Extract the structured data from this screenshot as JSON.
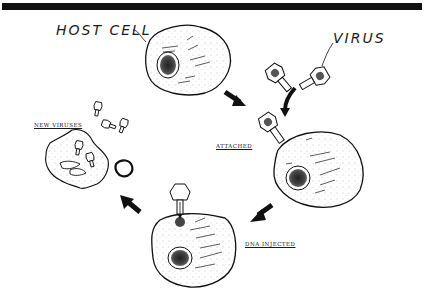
{
  "diagram": {
    "type": "lifecycle",
    "labels": {
      "host_cell": "HOST CELL",
      "virus": "VIRUS",
      "attached": "ATTACHED",
      "dna_injected": "DNA INJECTED",
      "new_viruses": "NEW VIRUSES"
    },
    "stages": [
      {
        "id": "host-cell",
        "label": "HOST CELL",
        "position": "top-center"
      },
      {
        "id": "virus",
        "label": "VIRUS",
        "position": "top-right"
      },
      {
        "id": "attached",
        "label": "ATTACHED",
        "position": "right"
      },
      {
        "id": "dna-injected",
        "label": "DNA INJECTED",
        "position": "bottom-center"
      },
      {
        "id": "new-viruses",
        "label": "NEW VIRUSES",
        "position": "left"
      }
    ],
    "flow": [
      "host-cell",
      "attached",
      "dna-injected",
      "new-viruses"
    ],
    "colors": {
      "ink": "#111111",
      "background": "#ffffff"
    }
  }
}
